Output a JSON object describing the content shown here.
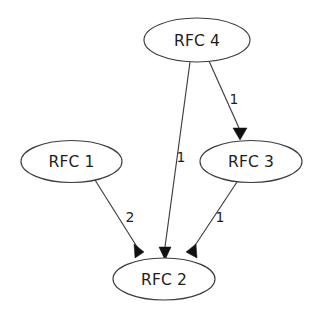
{
  "diagram": {
    "type": "directed-graph",
    "background_color": "#ffffff",
    "node_fill_color": "#ffffff",
    "node_stroke_color": "#3d3d3d",
    "edge_color": "#3d3d3d",
    "label_color": "#1e1e1e",
    "nodes": [
      {
        "id": "rfc4",
        "label": "RFC 4",
        "cx": 197,
        "cy": 40,
        "rx": 53,
        "ry": 22
      },
      {
        "id": "rfc1",
        "label": "RFC 1",
        "cx": 71.5,
        "cy": 161.5,
        "rx": 50.5,
        "ry": 21
      },
      {
        "id": "rfc3",
        "label": "RFC 3",
        "cx": 251,
        "cy": 161.5,
        "rx": 51,
        "ry": 21
      },
      {
        "id": "rfc2",
        "label": "RFC 2",
        "cx": 164,
        "cy": 279,
        "rx": 51,
        "ry": 21
      }
    ],
    "edges": [
      {
        "id": "e-rfc4-rfc3",
        "from": "RFC 4",
        "to": "RFC 3",
        "weight": "1",
        "label_x": 234,
        "label_y": 100,
        "path": "M 209,61 L 239,128",
        "arrow": "233,128 247,128 240,140"
      },
      {
        "id": "e-rfc4-rfc2",
        "from": "RFC 4",
        "to": "RFC 2",
        "weight": "1",
        "label_x": 181,
        "label_y": 158,
        "path": "M 190,62 L 165,247",
        "arrow": "159,247 171,247 165,260"
      },
      {
        "id": "e-rfc1-rfc2",
        "from": "RFC 1",
        "to": "RFC 2",
        "weight": "2",
        "label_x": 130,
        "label_y": 218,
        "path": "M 95,180 L 139,250",
        "arrow": "134,244 144,252 135,258"
      },
      {
        "id": "e-rfc3-rfc2",
        "from": "RFC 3",
        "to": "RFC 2",
        "weight": "1",
        "label_x": 220,
        "label_y": 218,
        "path": "M 237,182 L 192,250",
        "arrow": "186,252 196,244 197,258"
      }
    ]
  }
}
